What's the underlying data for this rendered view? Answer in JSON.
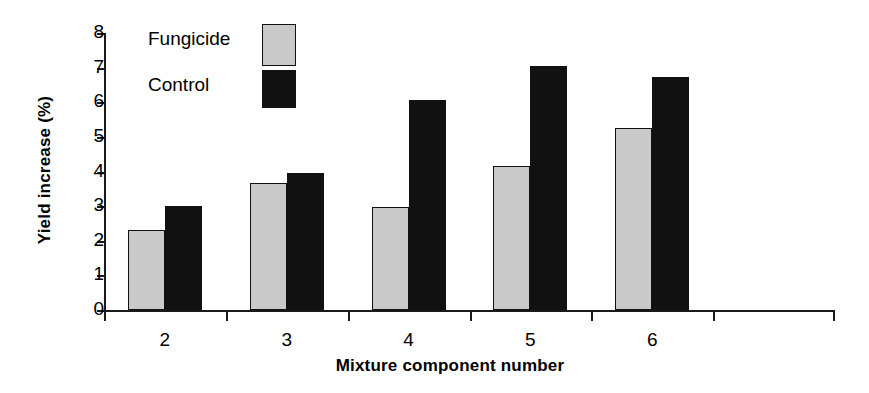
{
  "chart_data": {
    "type": "bar",
    "title": "",
    "xlabel": "Mixture component number",
    "ylabel": "Yield increase (%)",
    "categories": [
      "2",
      "3",
      "4",
      "5",
      "6"
    ],
    "series": [
      {
        "name": "Fungicide",
        "color": "#c9c9c9",
        "values": [
          2.3,
          3.68,
          2.97,
          4.17,
          5.25
        ]
      },
      {
        "name": "Control",
        "color": "#111111",
        "values": [
          3.0,
          3.97,
          6.06,
          7.05,
          6.73
        ]
      }
    ],
    "ylim": [
      0,
      8
    ],
    "yticks": [
      "0",
      "1",
      "2",
      "3",
      "4",
      "5",
      "6",
      "7",
      "8"
    ],
    "xticks": [
      "2",
      "3",
      "4",
      "5",
      "6",
      ""
    ],
    "grid": false,
    "legend_position": "top-left-inside"
  },
  "legend": {
    "entries": [
      {
        "label": "Fungicide",
        "swatch": "light-gray-swatch"
      },
      {
        "label": "Control",
        "swatch": "black-swatch"
      }
    ]
  }
}
